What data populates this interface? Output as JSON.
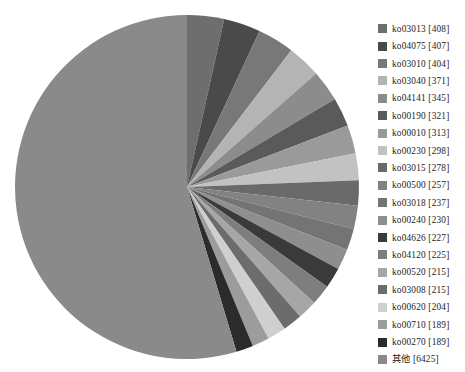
{
  "chart_data": {
    "type": "pie",
    "title": "",
    "subtitle": "",
    "xlabel": "",
    "ylabel": "",
    "grid": false,
    "legend_position": "right",
    "start_angle_deg": 0,
    "direction": "clockwise",
    "value_unit": "genes",
    "total": 11954,
    "categories": [
      "ko03013",
      "ko04075",
      "ko03010",
      "ko03040",
      "ko04141",
      "ko00190",
      "ko00010",
      "ko00230",
      "ko03015",
      "ko00500",
      "ko03018",
      "ko00240",
      "ko04626",
      "ko04120",
      "ko00520",
      "ko03008",
      "ko00620",
      "ko00710",
      "ko00270",
      "其他"
    ],
    "values": [
      408,
      407,
      404,
      371,
      345,
      321,
      313,
      298,
      278,
      257,
      237,
      230,
      227,
      225,
      215,
      215,
      204,
      189,
      189,
      6425
    ],
    "colors": [
      "#6e6e6e",
      "#4a4a4a",
      "#787878",
      "#b4b4b4",
      "#8c8c8c",
      "#5a5a5a",
      "#9a9a9a",
      "#c2c2c2",
      "#6a6a6a",
      "#828282",
      "#747474",
      "#8e8e8e",
      "#3a3a3a",
      "#7e7e7e",
      "#a6a6a6",
      "#6c6c6c",
      "#cfcfcf",
      "#9c9c9c",
      "#2b2b2b",
      "#8a8a8a"
    ],
    "legend_entries": [
      {
        "label": "ko03013 [408]",
        "name": "ko03013",
        "value": 408,
        "color": "#6e6e6e"
      },
      {
        "label": "ko04075 [407]",
        "name": "ko04075",
        "value": 407,
        "color": "#4a4a4a"
      },
      {
        "label": "ko03010 [404]",
        "name": "ko03010",
        "value": 404,
        "color": "#787878"
      },
      {
        "label": "ko03040 [371]",
        "name": "ko03040",
        "value": 371,
        "color": "#b4b4b4"
      },
      {
        "label": "ko04141 [345]",
        "name": "ko04141",
        "value": 345,
        "color": "#8c8c8c"
      },
      {
        "label": "ko00190 [321]",
        "name": "ko00190",
        "value": 321,
        "color": "#5a5a5a"
      },
      {
        "label": "ko00010 [313]",
        "name": "ko00010",
        "value": 313,
        "color": "#9a9a9a"
      },
      {
        "label": "ko00230 [298]",
        "name": "ko00230",
        "value": 298,
        "color": "#c2c2c2"
      },
      {
        "label": "ko03015 [278]",
        "name": "ko03015",
        "value": 278,
        "color": "#6a6a6a"
      },
      {
        "label": "ko00500 [257]",
        "name": "ko00500",
        "value": 257,
        "color": "#828282"
      },
      {
        "label": "ko03018 [237]",
        "name": "ko03018",
        "value": 237,
        "color": "#747474"
      },
      {
        "label": "ko00240 [230]",
        "name": "ko00240",
        "value": 230,
        "color": "#8e8e8e"
      },
      {
        "label": "ko04626 [227]",
        "name": "ko04626",
        "value": 227,
        "color": "#3a3a3a"
      },
      {
        "label": "ko04120 [225]",
        "name": "ko04120",
        "value": 225,
        "color": "#7e7e7e"
      },
      {
        "label": "ko00520 [215]",
        "name": "ko00520",
        "value": 215,
        "color": "#a6a6a6"
      },
      {
        "label": "ko03008 [215]",
        "name": "ko03008",
        "value": 215,
        "color": "#6c6c6c"
      },
      {
        "label": "ko00620 [204]",
        "name": "ko00620",
        "value": 204,
        "color": "#cfcfcf"
      },
      {
        "label": "ko00710 [189]",
        "name": "ko00710",
        "value": 189,
        "color": "#9c9c9c"
      },
      {
        "label": "ko00270 [189]",
        "name": "ko00270",
        "value": 189,
        "color": "#2b2b2b"
      },
      {
        "label": "其他 [6425]",
        "name": "其他",
        "value": 6425,
        "color": "#8a8a8a"
      }
    ]
  },
  "pie": {
    "center_x": 187,
    "center_y": 187,
    "radius": 172
  }
}
